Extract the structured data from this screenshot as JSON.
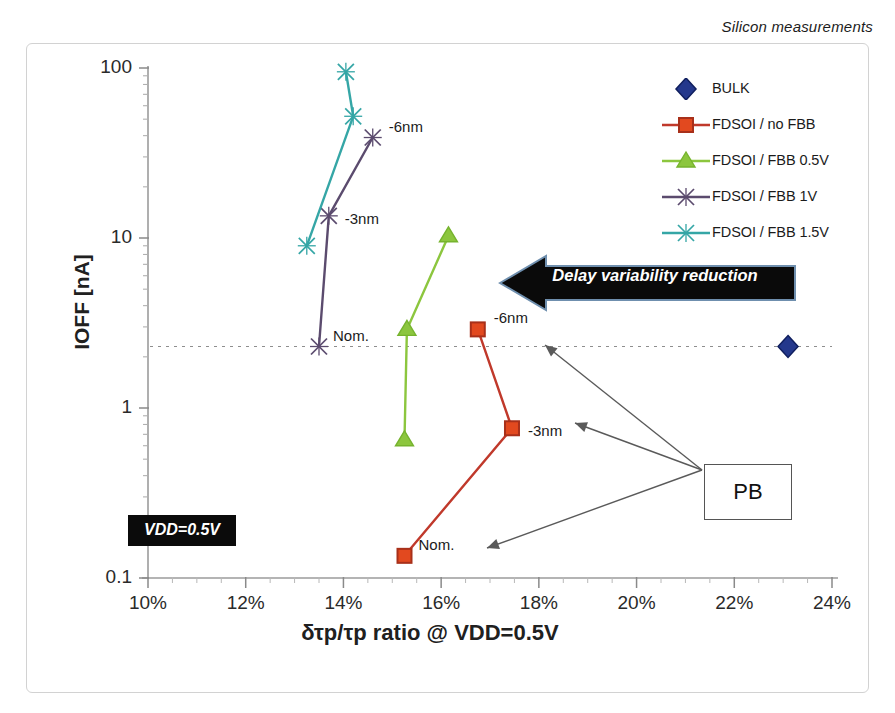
{
  "caption": "Silicon measurements",
  "annotations": {
    "banner_text": "Delay variability reduction",
    "vdd_box": "VDD=0.5V",
    "pb_box": "PB"
  },
  "legend": {
    "position": "top-right",
    "items": [
      {
        "label": "BULK",
        "color": "#1f3a93",
        "marker": "diamond",
        "line": false
      },
      {
        "label": "FDSOI / no FBB",
        "color": "#c0392b",
        "marker": "square",
        "line": true
      },
      {
        "label": "FDSOI / FBB 0.5V",
        "color": "#8cc63e",
        "marker": "triangle",
        "line": true
      },
      {
        "label": "FDSOI / FBB 1V",
        "color": "#5b4b6e",
        "marker": "x",
        "line": true
      },
      {
        "label": "FDSOI / FBB 1.5V",
        "color": "#35a6a6",
        "marker": "x",
        "line": true
      }
    ]
  },
  "chart_data": {
    "type": "scatter",
    "title": "",
    "subtitle": "Silicon measurements",
    "xlabel": "δτp/τp  ratio @ VDD=0.5V",
    "ylabel": "IOFF [nA]",
    "yscale": "log",
    "xlim": [
      10,
      24
    ],
    "ylim": [
      0.1,
      100
    ],
    "xticks": [
      "10%",
      "12%",
      "14%",
      "16%",
      "18%",
      "20%",
      "22%",
      "24%"
    ],
    "xtick_values": [
      10,
      12,
      14,
      16,
      18,
      20,
      22,
      24
    ],
    "yticks": [
      "0.1",
      "1",
      "10",
      "100"
    ],
    "ytick_values": [
      0.1,
      1,
      10,
      100
    ],
    "grid": false,
    "reference_line": {
      "y": 2.3,
      "style": "dotted",
      "label": ""
    },
    "series": [
      {
        "name": "BULK",
        "color": "#1f3a93",
        "marker": "diamond",
        "points": [
          {
            "x": 23.1,
            "y": 2.3,
            "label": ""
          }
        ]
      },
      {
        "name": "FDSOI / no FBB",
        "color": "#c0392b",
        "marker": "square",
        "points": [
          {
            "x": 15.25,
            "y": 0.135,
            "label": "Nom."
          },
          {
            "x": 17.45,
            "y": 0.76,
            "label": "-3nm"
          },
          {
            "x": 16.75,
            "y": 2.9,
            "label": "-6nm"
          }
        ]
      },
      {
        "name": "FDSOI / FBB 0.5V",
        "color": "#8cc63e",
        "marker": "triangle",
        "points": [
          {
            "x": 15.25,
            "y": 0.65,
            "label": ""
          },
          {
            "x": 15.3,
            "y": 2.9,
            "label": ""
          },
          {
            "x": 16.15,
            "y": 10.3,
            "label": ""
          }
        ]
      },
      {
        "name": "FDSOI / FBB 1V",
        "color": "#5b4b6e",
        "marker": "x",
        "points": [
          {
            "x": 13.5,
            "y": 2.3,
            "label": "Nom."
          },
          {
            "x": 13.7,
            "y": 13.5,
            "label": "-3nm"
          },
          {
            "x": 14.6,
            "y": 39.0,
            "label": "-6nm"
          }
        ]
      },
      {
        "name": "FDSOI / FBB 1.5V",
        "color": "#35a6a6",
        "marker": "x",
        "points": [
          {
            "x": 13.25,
            "y": 9.0,
            "label": ""
          },
          {
            "x": 14.2,
            "y": 52.0,
            "label": ""
          },
          {
            "x": 14.05,
            "y": 95.0,
            "label": ""
          }
        ]
      }
    ],
    "callouts": [
      {
        "text": "PB",
        "targets": [
          "FDSOI / no FBB Nom.",
          "FDSOI / no FBB -3nm",
          "FDSOI / no FBB -6nm"
        ]
      }
    ]
  }
}
